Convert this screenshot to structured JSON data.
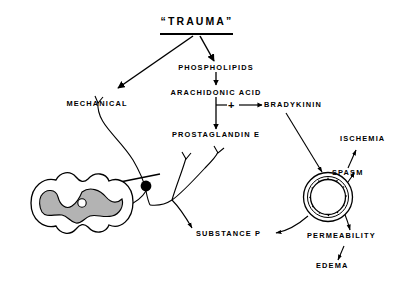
{
  "diagram": {
    "title": "“TRAUMA”",
    "title_plain": "TRAUMA",
    "background_color": "#ffffff",
    "ink_color": "#000000",
    "gray_matter_color": "#b3b3b3",
    "nodes": {
      "trauma": "“TRAUMA”",
      "mechanical": "MECHANICAL",
      "phospholipids": "PHOSPHOLIPIDS",
      "arachidonic_acid": "ARACHIDONIC ACID",
      "prostaglandin_e": "PROSTAGLANDIN E",
      "bradykinin": "BRADYKININ",
      "substance_p": "SUBSTANCE P",
      "ischemia": "ISCHEMIA",
      "spasm": "SPASM",
      "permeability": "PERMEABILITY",
      "edema": "EDEMA",
      "plus": "+"
    },
    "figures": {
      "spinal_cord": "spinal-cord-cross-section",
      "blood_vessel": "blood-vessel-cross-section",
      "ganglion": "dorsal-root-ganglion",
      "nerve_endings": "free-nerve-endings"
    },
    "edges": [
      {
        "from": "trauma",
        "to": "mechanical"
      },
      {
        "from": "trauma",
        "to": "phospholipids"
      },
      {
        "from": "phospholipids",
        "to": "arachidonic_acid"
      },
      {
        "from": "arachidonic_acid",
        "to": "prostaglandin_e"
      },
      {
        "from": "arachidonic_acid",
        "to": "bradykinin"
      },
      {
        "from": "bradykinin",
        "to": "blood_vessel"
      },
      {
        "from": "blood_vessel",
        "to": "spasm"
      },
      {
        "from": "spasm",
        "to": "ischemia"
      },
      {
        "from": "blood_vessel",
        "to": "permeability"
      },
      {
        "from": "permeability",
        "to": "edema"
      },
      {
        "from": "blood_vessel",
        "to": "substance_p"
      },
      {
        "from": "ganglion",
        "to": "spinal_cord"
      }
    ]
  }
}
